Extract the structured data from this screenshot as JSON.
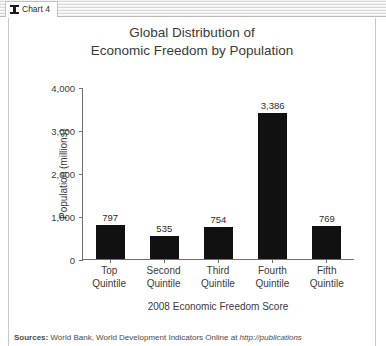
{
  "window": {
    "tab": {
      "label": "Chart 4",
      "icon": "bar-chart-icon"
    }
  },
  "chart_data": {
    "type": "bar",
    "title": "Global Distribution of Economic Freedom by Population",
    "title_line1": "Global Distribution of",
    "title_line2": "Economic Freedom by Population",
    "xlabel": "2008 Economic Freedom Score",
    "ylabel": "Population (millions)",
    "categories": [
      "Top Quintile",
      "Second Quintile",
      "Third Quintile",
      "Fourth Quintile",
      "Fifth Quintile"
    ],
    "category_lines": [
      [
        "Top",
        "Quintile"
      ],
      [
        "Second",
        "Quintile"
      ],
      [
        "Third",
        "Quintile"
      ],
      [
        "Fourth",
        "Quintile"
      ],
      [
        "Fifth",
        "Quintile"
      ]
    ],
    "values": [
      797,
      535,
      754,
      3386,
      769
    ],
    "value_labels": [
      "797",
      "535",
      "754",
      "3,386",
      "769"
    ],
    "ylim": [
      0,
      4000
    ],
    "yticks": [
      0,
      1000,
      2000,
      3000,
      4000
    ],
    "ytick_labels": [
      "0",
      "1,000",
      "2,000",
      "3,000",
      "4,000"
    ],
    "grid": false,
    "legend": null,
    "bar_color": "#111111",
    "axis_color": "#6f6f6f"
  },
  "footer": {
    "source_lead": "Sources:",
    "source_text": " World Bank, World Development Indicators Online at ",
    "source_url": "http://publications"
  }
}
